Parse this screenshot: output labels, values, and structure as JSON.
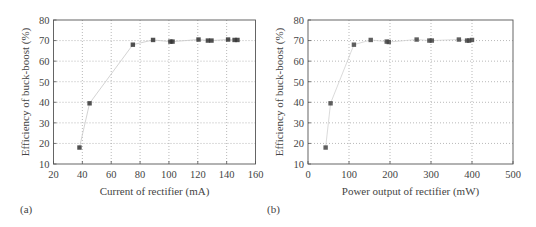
{
  "chart_data": [
    {
      "type": "scatter",
      "panel_label": "(a)",
      "title": "",
      "xlabel": "Current of rectifier (mA)",
      "ylabel": "Efficiency of buck-boost (%)",
      "xlim": [
        20,
        160
      ],
      "ylim": [
        10,
        80
      ],
      "xticks": [
        20,
        40,
        60,
        80,
        100,
        120,
        140,
        160
      ],
      "yticks": [
        10,
        20,
        30,
        40,
        50,
        60,
        70,
        80
      ],
      "grid": true,
      "legend": null,
      "series": [
        {
          "name": "Efficiency",
          "marker": "square",
          "color": "#333333",
          "line_color": "#c8c8c8",
          "x": [
            38,
            45,
            75,
            89,
            101,
            102.5,
            120.5,
            127,
            129.5,
            141,
            145.5,
            147.5
          ],
          "y": [
            18,
            39.5,
            68,
            70.3,
            69.5,
            69.5,
            70.5,
            70,
            70,
            70.5,
            70.3,
            70.3
          ]
        }
      ]
    },
    {
      "type": "scatter",
      "panel_label": "(b)",
      "title": "",
      "xlabel": "Power output of rectifier (mW)",
      "ylabel": "Efficiency of buck-boost (%)",
      "xlim": [
        0,
        500
      ],
      "ylim": [
        10,
        80
      ],
      "xticks": [
        0,
        100,
        200,
        300,
        400,
        500
      ],
      "yticks": [
        10,
        20,
        30,
        40,
        50,
        60,
        70,
        80
      ],
      "grid": true,
      "legend": null,
      "series": [
        {
          "name": "Efficiency",
          "marker": "square",
          "color": "#444444",
          "line_color": "#d0d0d0",
          "x": [
            43,
            55,
            112,
            153,
            192,
            197,
            265,
            296,
            302,
            368,
            388,
            393,
            400
          ],
          "y": [
            18,
            39.5,
            68,
            70.3,
            69.5,
            69.3,
            70.5,
            70,
            70,
            70.5,
            70,
            70,
            70.3
          ]
        }
      ]
    }
  ]
}
